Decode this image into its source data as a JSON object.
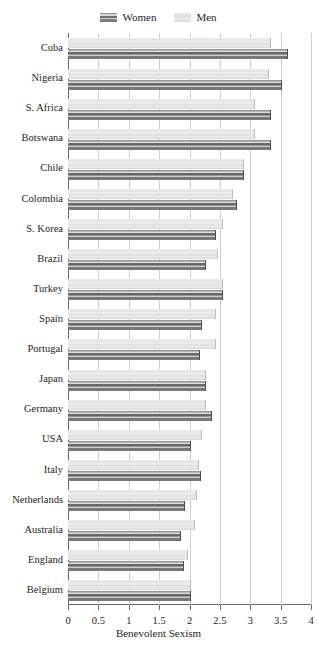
{
  "legend": {
    "position": "top-center",
    "entries": [
      {
        "label": "Women",
        "swatch": "women-swatch-icon",
        "color": "#6f6f6f"
      },
      {
        "label": "Men",
        "swatch": "men-swatch-icon",
        "color": "#e4e4e4"
      }
    ]
  },
  "axis": {
    "x_title": "Benevolent Sexism",
    "x_ticks": [
      "0",
      "0.5",
      "1",
      "1.5",
      "2",
      "2.5",
      "3",
      "3.5",
      "4"
    ]
  },
  "chart_data": {
    "type": "bar",
    "orientation": "horizontal",
    "title": "",
    "subtitle": "",
    "xlabel": "Benevolent Sexism",
    "ylabel": "",
    "xlim": [
      0,
      4
    ],
    "xticks": [
      0,
      0.5,
      1,
      1.5,
      2,
      2.5,
      3,
      3.5,
      4
    ],
    "grid": "vertical",
    "legend_position": "top-center",
    "categories": [
      "Cuba",
      "Nigeria",
      "S. Africa",
      "Botswana",
      "Chile",
      "Colombia",
      "S. Korea",
      "Brazil",
      "Turkey",
      "Spain",
      "Portugal",
      "Japan",
      "Germany",
      "USA",
      "Italy",
      "Netherlands",
      "Australia",
      "England",
      "Belgium"
    ],
    "series": [
      {
        "name": "Women",
        "color": "#6f6f6f",
        "values": [
          3.6,
          3.5,
          3.32,
          3.32,
          2.88,
          2.77,
          2.42,
          2.25,
          2.53,
          2.19,
          2.16,
          2.25,
          2.35,
          2.01,
          2.17,
          1.91,
          1.84,
          1.89,
          2.01
        ]
      },
      {
        "name": "Men",
        "color": "#e4e4e4",
        "values": [
          3.32,
          3.29,
          3.06,
          3.06,
          2.88,
          2.7,
          2.53,
          2.45,
          2.53,
          2.42,
          2.42,
          2.25,
          2.25,
          2.19,
          2.14,
          2.11,
          2.07,
          1.96,
          2.01
        ]
      }
    ]
  }
}
